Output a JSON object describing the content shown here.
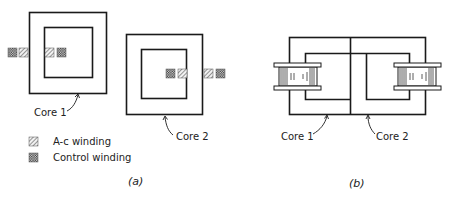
{
  "figure_a": {
    "caption": "(a)",
    "core1_label": "Core 1",
    "core2_label": "Core 2",
    "legend": [
      {
        "pattern": "hatched",
        "label": "A-c winding"
      },
      {
        "pattern": "crosshatched",
        "label": "Control winding"
      }
    ]
  },
  "figure_b": {
    "caption": "(b)",
    "core1_label": "Core 1",
    "core2_label": "Core 2"
  },
  "colors": {
    "line": "#1a1a1a",
    "background": "#ffffff"
  }
}
